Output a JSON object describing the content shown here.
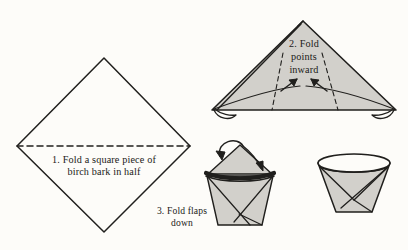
{
  "figure": {
    "background_color": "#fdfcf9",
    "ink_color": "#201f1d",
    "fill_color": "#d2d0cb",
    "steps": [
      {
        "id": "step-1",
        "number": "1.",
        "caption_line_1": "1. Fold a square piece of",
        "caption_line_2": "birch bark in half",
        "shape": "square-diamond",
        "fold_line": "horizontal-dashed"
      },
      {
        "id": "step-2",
        "number": "2.",
        "caption_line_1": "2. Fold",
        "caption_line_2": "points",
        "caption_line_3": "inward",
        "shape": "triangle",
        "fold_line": "two-dashed-diagonals",
        "arrows": 2
      },
      {
        "id": "step-3",
        "number": "3.",
        "caption_line_1": "3. Fold flaps",
        "caption_line_2": "down",
        "shape": "kite-with-band",
        "arrows": 1
      },
      {
        "id": "step-4",
        "number": "4.",
        "caption_line_1": "",
        "caption_line_2": "",
        "shape": "finished-cup"
      }
    ]
  }
}
